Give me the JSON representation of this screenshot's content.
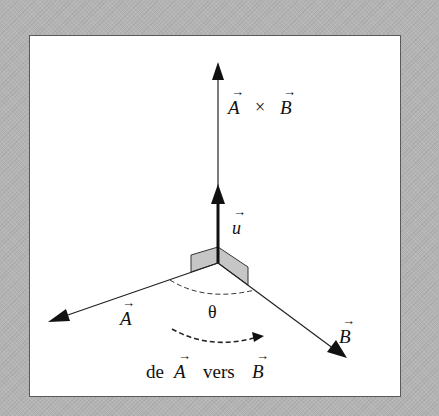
{
  "figure": {
    "background_color": "#b4b4b4",
    "panel_color": "#ffffff",
    "flap_color": "#c4c4c4",
    "line_color": "#222222",
    "labels": {
      "cross_product": {
        "a": "A",
        "times": "×",
        "b": "B"
      },
      "unit_vector": "u",
      "vector_a": "A",
      "vector_b": "B",
      "angle": "θ",
      "direction_caption": {
        "prefix": "de",
        "a": "A",
        "middle": "vers",
        "b": "B"
      }
    },
    "vector_arrow_glyph": "→"
  }
}
